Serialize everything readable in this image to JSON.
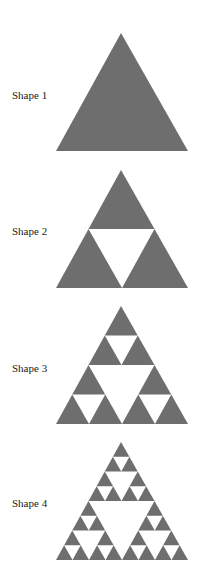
{
  "colors": {
    "fill": "#6e6e6e",
    "background": "#ffffff",
    "text": "#222222"
  },
  "shapes": [
    {
      "label": "Shape 1",
      "iteration": 0,
      "label_pos": [
        12,
        89
      ],
      "apex": [
        121,
        33
      ],
      "base_y": 151,
      "left_x": 56,
      "right_x": 188
    },
    {
      "label": "Shape 2",
      "iteration": 1,
      "label_pos": [
        12,
        225
      ],
      "apex": [
        121,
        170
      ],
      "base_y": 288,
      "left_x": 56,
      "right_x": 188
    },
    {
      "label": "Shape 3",
      "iteration": 2,
      "label_pos": [
        12,
        362
      ],
      "apex": [
        121,
        306
      ],
      "base_y": 424,
      "left_x": 56,
      "right_x": 188
    },
    {
      "label": "Shape 4",
      "iteration": 3,
      "label_pos": [
        12,
        497
      ],
      "apex": [
        121,
        442
      ],
      "base_y": 560,
      "left_x": 56,
      "right_x": 188
    }
  ]
}
